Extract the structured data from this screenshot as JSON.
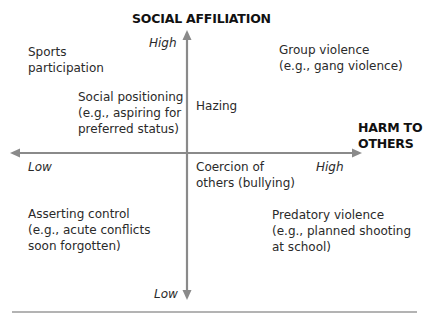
{
  "diagram": {
    "y_axis": {
      "title": "SOCIAL AFFILIATION",
      "high_label": "High",
      "low_label": "Low"
    },
    "x_axis": {
      "title_line1": "HARM TO",
      "title_line2": "OTHERS",
      "high_label": "High",
      "low_label": "Low"
    },
    "items": {
      "sports": {
        "line1": "Sports",
        "line2": "participation"
      },
      "social_positioning": {
        "line1": "Social positioning",
        "line2": "(e.g., aspiring for",
        "line3": "preferred status)"
      },
      "hazing": {
        "line1": "Hazing"
      },
      "group_violence": {
        "line1": "Group violence",
        "line2": "(e.g., gang violence)"
      },
      "coercion": {
        "line1": "Coercion of",
        "line2": "others (bullying)"
      },
      "asserting_control": {
        "line1": "Asserting control",
        "line2": "(e.g., acute conflicts",
        "line3": "soon forgotten)"
      },
      "predatory_violence": {
        "line1": "Predatory violence",
        "line2": "(e.g., planned shooting",
        "line3": "at school)"
      }
    },
    "colors": {
      "axis": "#8a8a8a",
      "text": "#2a2a2a",
      "title": "#111111",
      "rule": "#9a9a9a"
    }
  }
}
